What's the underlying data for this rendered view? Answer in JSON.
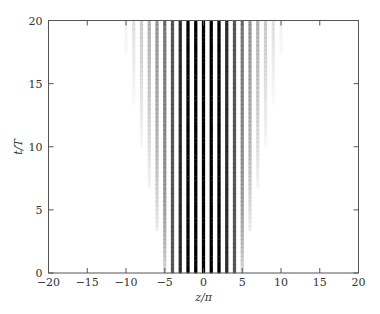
{
  "chart_data": {
    "type": "heatmap",
    "title": "",
    "xlabel": "z/π",
    "ylabel": "t/T",
    "xlim": [
      -20,
      20
    ],
    "ylim": [
      0,
      20
    ],
    "xticks": [
      -20,
      -15,
      -10,
      -5,
      0,
      5,
      10,
      15,
      20
    ],
    "yticks": [
      0,
      5,
      10,
      15,
      20
    ],
    "grid": false,
    "colormap": "grayscale (white = 0, black = max)",
    "pattern": {
      "fringe_period": 1,
      "fringe_phase_center": 0,
      "envelope_halfwidth_at_t0": 5,
      "envelope_halfwidth_at_t20": 11,
      "core_dark_halfwidth_at_t0": 4,
      "core_dark_halfwidth_at_t20": 4
    },
    "samples": [
      {
        "t": 0,
        "visible_fringe_range": [
          -5,
          5
        ]
      },
      {
        "t": 10,
        "visible_fringe_range": [
          -8,
          8
        ]
      },
      {
        "t": 20,
        "visible_fringe_range": [
          -11,
          11
        ]
      }
    ]
  },
  "colors": {
    "axis": "#555555",
    "fringe": "#000000",
    "background": "#ffffff"
  }
}
